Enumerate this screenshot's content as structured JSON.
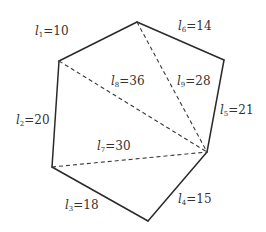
{
  "diagram": {
    "type": "polygon-triangulation",
    "vertices": {
      "A": [
        59,
        61
      ],
      "B": [
        137,
        22
      ],
      "C": [
        224,
        60
      ],
      "D": [
        207,
        152
      ],
      "E": [
        148,
        221
      ],
      "F": [
        52,
        167
      ]
    },
    "edges": [
      {
        "id": "l1",
        "from": "A",
        "to": "B",
        "style": "solid",
        "var": "l",
        "sub": "1",
        "text": "=10",
        "value": 10,
        "pos": [
          35,
          25
        ]
      },
      {
        "id": "l6",
        "from": "B",
        "to": "C",
        "style": "solid",
        "var": "l",
        "sub": "6",
        "text": "=14",
        "value": 14,
        "pos": [
          178,
          20
        ]
      },
      {
        "id": "l5",
        "from": "C",
        "to": "D",
        "style": "solid",
        "var": "l",
        "sub": "5",
        "text": "=21",
        "value": 21,
        "pos": [
          220,
          104
        ]
      },
      {
        "id": "l4",
        "from": "D",
        "to": "E",
        "style": "solid",
        "var": "l",
        "sub": "4",
        "text": "=15",
        "value": 15,
        "pos": [
          178,
          193
        ]
      },
      {
        "id": "l3",
        "from": "E",
        "to": "F",
        "style": "solid",
        "var": "l",
        "sub": "3",
        "text": "=18",
        "value": 18,
        "pos": [
          65,
          199
        ]
      },
      {
        "id": "l2",
        "from": "F",
        "to": "A",
        "style": "solid",
        "var": "l",
        "sub": "2",
        "text": "=20",
        "value": 20,
        "pos": [
          16,
          114
        ]
      },
      {
        "id": "l8",
        "from": "A",
        "to": "D",
        "style": "dashed",
        "var": "l",
        "sub": "8",
        "text": "=36",
        "value": 36,
        "pos": [
          111,
          75
        ]
      },
      {
        "id": "l9",
        "from": "B",
        "to": "D",
        "style": "dashed",
        "var": "l",
        "sub": "9",
        "text": "=28",
        "value": 28,
        "pos": [
          177,
          75
        ]
      },
      {
        "id": "l7",
        "from": "F",
        "to": "D",
        "style": "dashed",
        "var": "l",
        "sub": "7",
        "text": "=30",
        "value": 30,
        "pos": [
          97,
          140
        ]
      }
    ]
  }
}
